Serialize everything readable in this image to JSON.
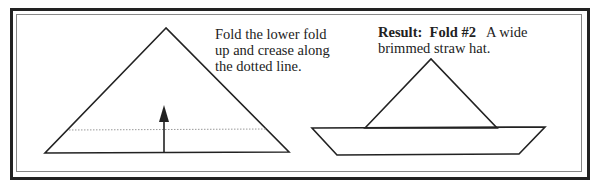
{
  "step1": {
    "caption_line1": "Fold the lower fold",
    "caption_line2": "up and crease along",
    "caption_line3": "the dotted line."
  },
  "step2": {
    "result_label": "Result:",
    "fold_label": "Fold #2",
    "desc_line1": "A wide",
    "desc_line2": "brimmed straw hat."
  }
}
